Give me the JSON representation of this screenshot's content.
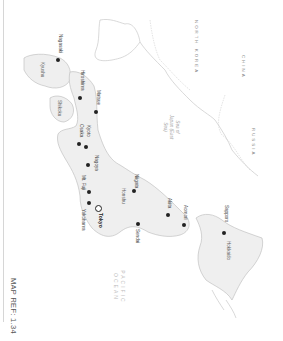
{
  "map": {
    "orientation": "rotated 90 degrees clockwise",
    "reference": "MAP REF: 1.34",
    "colors": {
      "land": "#efefef",
      "coast": "#b8b8b8",
      "border": "#c4c4c4",
      "city_dot": "#222222",
      "background": "#ffffff"
    },
    "countries": [
      {
        "name": "NORTH KOREA"
      },
      {
        "name": "CHINA"
      },
      {
        "name": "RUSSIA"
      }
    ],
    "water_bodies": [
      {
        "name": "Sea of Japan (East Sea)"
      },
      {
        "name": "PACIFIC OCEAN"
      }
    ],
    "regions": [
      {
        "name": "Kyushu"
      },
      {
        "name": "Shikoku"
      },
      {
        "name": "Honshu"
      },
      {
        "name": "Hokkaido"
      }
    ],
    "capital": {
      "name": "Tokyo"
    },
    "cities": [
      {
        "name": "Nagasaki"
      },
      {
        "name": "Hiroshima"
      },
      {
        "name": "Matsue"
      },
      {
        "name": "Kyoto"
      },
      {
        "name": "Osaka"
      },
      {
        "name": "Nagoya"
      },
      {
        "name": "Mt. Fuji"
      },
      {
        "name": "Yokohama"
      },
      {
        "name": "Niigata"
      },
      {
        "name": "Sendai"
      },
      {
        "name": "Akita"
      },
      {
        "name": "Aomori"
      },
      {
        "name": "Sapporo"
      }
    ]
  }
}
